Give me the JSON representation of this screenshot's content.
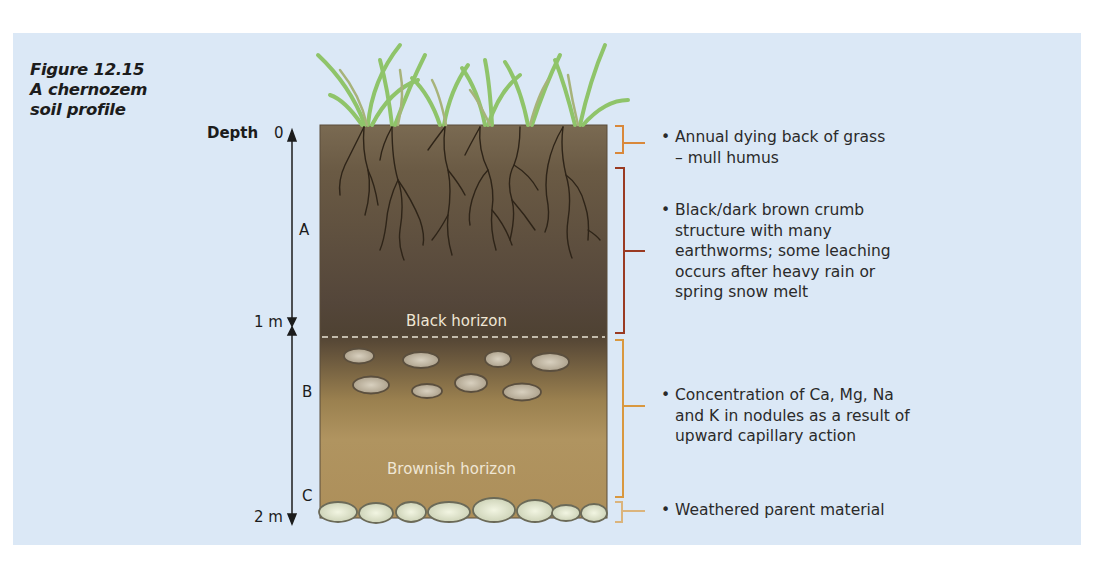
{
  "figure": {
    "number": "Figure 12.15",
    "caption_lines": [
      "Figure 12.15",
      "A chernozem",
      "soil profile"
    ]
  },
  "depth_scale": {
    "title": "Depth",
    "ticks": [
      {
        "label": "0",
        "position": "top"
      },
      {
        "label": "1 m",
        "position": "middle"
      },
      {
        "label": "2 m",
        "position": "bottom"
      }
    ],
    "horizons": [
      {
        "letter": "A"
      },
      {
        "letter": "B"
      },
      {
        "letter": "C"
      }
    ]
  },
  "profile": {
    "horizon_labels": {
      "black": "Black horizon",
      "brownish": "Brownish horizon"
    },
    "colors": {
      "background_panel": "#dbe8f6",
      "topsoil_dark": "#5a4a36",
      "topsoil_light": "#7d6a4f",
      "subsoil": "#b0925e",
      "stones": "#d9dcc2",
      "grass": "#8fc46a",
      "roots": "#2e2418",
      "bracket_orange": "#d98c3a",
      "bracket_red": "#9a3a22",
      "bracket_tan": "#d6a96a"
    }
  },
  "annotations": [
    {
      "bullet": "•",
      "lines": [
        "Annual dying back of grass",
        "– mull humus"
      ]
    },
    {
      "bullet": "•",
      "lines": [
        "Black/dark brown crumb",
        "structure with many",
        "earthworms; some leaching",
        "occurs after heavy rain or",
        "spring snow melt"
      ]
    },
    {
      "bullet": "•",
      "lines": [
        "Concentration of Ca, Mg, Na",
        "and K in nodules as a result of",
        "upward capillary action"
      ]
    },
    {
      "bullet": "•",
      "lines": [
        "Weathered parent material"
      ]
    }
  ]
}
